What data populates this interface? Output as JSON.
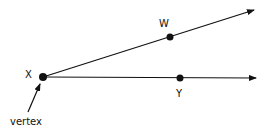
{
  "diagram": {
    "type": "angle",
    "points": {
      "vertex": {
        "label": "X",
        "x": 43,
        "y": 77
      },
      "w": {
        "label": "W",
        "x": 170,
        "y": 37
      },
      "y": {
        "label": "Y",
        "x": 180,
        "y": 78
      }
    },
    "rays": [
      {
        "from": "X",
        "through": "W",
        "end": [
          254,
          10
        ]
      },
      {
        "from": "X",
        "through": "Y",
        "end": [
          256,
          78
        ]
      }
    ],
    "annotation": {
      "text": "vertex",
      "arrow_from": [
        28,
        112
      ],
      "arrow_to": [
        40,
        84
      ]
    },
    "colors": {
      "stroke": "#111111",
      "background": "#ffffff"
    }
  }
}
